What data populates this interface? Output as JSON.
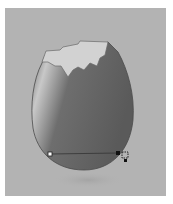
{
  "canvas": {
    "background": "#b3b3b3",
    "page_background": "#ffffff"
  },
  "artwork": {
    "subject": "cracked-eggshell",
    "shell_dark": "#5f5f5f",
    "shell_highlight": "#c9c9c9",
    "inner_shell": "#d4d4d4",
    "outline": "#4a4a4a"
  },
  "gradient_annotator": {
    "start_stop": "hollow-square",
    "end_stop": "filled-square",
    "line_color": "#333333"
  },
  "cursor": {
    "icon": "gradient-tool-cursor-icon"
  }
}
